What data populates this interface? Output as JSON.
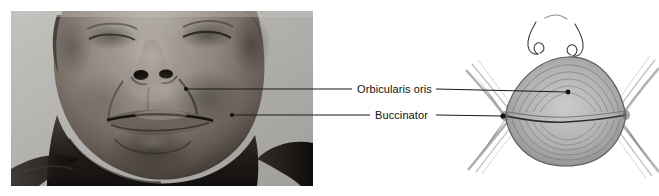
{
  "figure": {
    "background_color": "#ffffff",
    "width": 659,
    "height": 196
  },
  "photo": {
    "caption": "",
    "description": "Grayscale clinical photograph of an older man's lower face with eyes closed, showing the perioral region",
    "tone_light": "#d8d6d2",
    "tone_mid": "#8a8782",
    "tone_dark": "#2b2a28"
  },
  "labels": [
    {
      "id": "orbicularis-oris",
      "text": "Orbicularis oris",
      "leader_color": "#1a1a1a"
    },
    {
      "id": "buccinator",
      "text": "Buccinator",
      "leader_color": "#1a1a1a"
    }
  ],
  "diagram": {
    "title": "",
    "muscle_fill": "#b9b8b6",
    "muscle_stroke": "#5e5d5b",
    "nose_stroke": "#3a3a3a"
  }
}
